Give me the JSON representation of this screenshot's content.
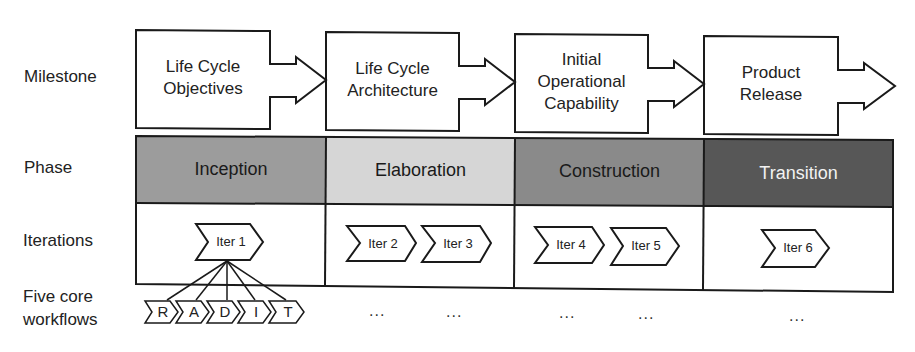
{
  "row_labels": {
    "milestone": "Milestone",
    "phase": "Phase",
    "iterations": "Iterations",
    "workflows_line1": "Five core",
    "workflows_line2": "workflows"
  },
  "milestones": [
    {
      "line1": "Life Cycle",
      "line2": "Objectives",
      "line3": ""
    },
    {
      "line1": "Life Cycle",
      "line2": "Architecture",
      "line3": ""
    },
    {
      "line1": "Initial",
      "line2": "Operational",
      "line3": "Capability"
    },
    {
      "line1": "Product",
      "line2": "Release",
      "line3": ""
    }
  ],
  "phases": [
    {
      "label": "Inception",
      "color": "#9c9c9c",
      "text_color": "#1a1a1a"
    },
    {
      "label": "Elaboration",
      "color": "#d6d6d6",
      "text_color": "#1a1a1a"
    },
    {
      "label": "Construction",
      "color": "#8a8a8a",
      "text_color": "#1a1a1a"
    },
    {
      "label": "Transition",
      "color": "#575757",
      "text_color": "#f2f2f2"
    }
  ],
  "iterations": [
    "Iter 1",
    "Iter 2",
    "Iter 3",
    "Iter 4",
    "Iter 5",
    "Iter 6"
  ],
  "workflows": [
    "R",
    "A",
    "D",
    "I",
    "T"
  ],
  "ellipsis": "..."
}
